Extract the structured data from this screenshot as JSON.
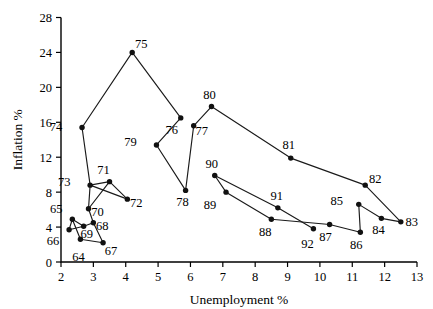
{
  "chart_data": {
    "type": "line",
    "title": "",
    "subtitle": "",
    "xlabel": "Unemployment %",
    "ylabel": "Inflation %",
    "xlim": [
      2,
      13
    ],
    "ylim": [
      0,
      28
    ],
    "xticks": [
      2,
      3,
      4,
      5,
      6,
      7,
      8,
      9,
      10,
      11,
      12,
      13
    ],
    "yticks": [
      0,
      4,
      8,
      12,
      16,
      20,
      24,
      28
    ],
    "xtick_labels": [
      "2",
      "3",
      "4",
      "5",
      "6",
      "7",
      "8",
      "9",
      "10",
      "11",
      "12",
      "13"
    ],
    "ytick_labels": [
      "0",
      "4",
      "8",
      "12",
      "16",
      "20",
      "24",
      "28"
    ],
    "grid": false,
    "legend": "none",
    "marker": "filled-circle",
    "line_color": "#1a1a1a",
    "marker_color": "#111111",
    "series": [
      {
        "name": "Phillips curve loop 1964-1992",
        "point_label_key": "year",
        "points": [
          {
            "year": "64",
            "x": 2.6,
            "y": 2.6,
            "label_dx": -2,
            "label_dy": 22
          },
          {
            "year": "65",
            "x": 2.35,
            "y": 4.9,
            "label_dx": -16,
            "label_dy": -6
          },
          {
            "year": "66",
            "x": 2.25,
            "y": 3.7,
            "label_dx": -16,
            "label_dy": 15
          },
          {
            "year": "67",
            "x": 3.3,
            "y": 2.2,
            "label_dx": 8,
            "label_dy": 12
          },
          {
            "year": "68",
            "x": 3.0,
            "y": 4.5,
            "label_dx": 9,
            "label_dy": 7
          },
          {
            "year": "69",
            "x": 2.7,
            "y": 4.1,
            "label_dx": 3,
            "label_dy": 12
          },
          {
            "year": "70",
            "x": 2.85,
            "y": 6.1,
            "label_dx": 9,
            "label_dy": 7
          },
          {
            "year": "71",
            "x": 3.5,
            "y": 9.2,
            "label_dx": -6,
            "label_dy": -8
          },
          {
            "year": "72",
            "x": 4.05,
            "y": 7.2,
            "label_dx": 9,
            "label_dy": 8
          },
          {
            "year": "73",
            "x": 2.9,
            "y": 8.8,
            "label_dx": -26,
            "label_dy": 1
          },
          {
            "year": "74",
            "x": 2.65,
            "y": 15.4,
            "label_dx": -26,
            "label_dy": 3
          },
          {
            "year": "75",
            "x": 4.2,
            "y": 24.0,
            "label_dx": 9,
            "label_dy": -4
          },
          {
            "year": "76",
            "x": 5.7,
            "y": 16.5,
            "label_dx": -9,
            "label_dy": 16
          },
          {
            "year": "77",
            "x": 6.1,
            "y": 15.6,
            "label_dx": 8,
            "label_dy": 9
          },
          {
            "year": "78",
            "x": 5.85,
            "y": 8.2,
            "label_dx": -3,
            "label_dy": 16
          },
          {
            "year": "79",
            "x": 4.95,
            "y": 13.4,
            "label_dx": -26,
            "label_dy": 1
          },
          {
            "year": "80",
            "x": 6.65,
            "y": 17.8,
            "label_dx": -2,
            "label_dy": -8
          },
          {
            "year": "81",
            "x": 9.1,
            "y": 11.9,
            "label_dx": -2,
            "label_dy": -9
          },
          {
            "year": "82",
            "x": 11.4,
            "y": 8.8,
            "label_dx": 10,
            "label_dy": -2
          },
          {
            "year": "83",
            "x": 12.5,
            "y": 4.6,
            "label_dx": 11,
            "label_dy": 4
          },
          {
            "year": "84",
            "x": 11.9,
            "y": 5.0,
            "label_dx": -3,
            "label_dy": 16
          },
          {
            "year": "85",
            "x": 11.2,
            "y": 6.6,
            "label_dx": -22,
            "label_dy": 1
          },
          {
            "year": "86",
            "x": 11.25,
            "y": 3.4,
            "label_dx": -4,
            "label_dy": 17
          },
          {
            "year": "87",
            "x": 10.3,
            "y": 4.3,
            "label_dx": -4,
            "label_dy": 17
          },
          {
            "year": "88",
            "x": 8.5,
            "y": 4.9,
            "label_dx": -6,
            "label_dy": 17
          },
          {
            "year": "89",
            "x": 7.1,
            "y": 8.0,
            "label_dx": -16,
            "label_dy": 17
          },
          {
            "year": "90",
            "x": 6.75,
            "y": 9.9,
            "label_dx": -3,
            "label_dy": -8
          },
          {
            "year": "91",
            "x": 8.7,
            "y": 6.2,
            "label_dx": -1,
            "label_dy": -8
          },
          {
            "year": "92",
            "x": 9.8,
            "y": 3.8,
            "label_dx": -6,
            "label_dy": 19
          }
        ],
        "segments": [
          [
            "64",
            "65"
          ],
          [
            "65",
            "66"
          ],
          [
            "66",
            "69"
          ],
          [
            "69",
            "65"
          ],
          [
            "69",
            "68"
          ],
          [
            "68",
            "70"
          ],
          [
            "70",
            "71"
          ],
          [
            "71",
            "73"
          ],
          [
            "71",
            "72"
          ],
          [
            "73",
            "74"
          ],
          [
            "73",
            "70"
          ],
          [
            "74",
            "75"
          ],
          [
            "75",
            "76"
          ],
          [
            "76",
            "79"
          ],
          [
            "79",
            "78"
          ],
          [
            "78",
            "77"
          ],
          [
            "77",
            "80"
          ],
          [
            "80",
            "81"
          ],
          [
            "81",
            "82"
          ],
          [
            "82",
            "83"
          ],
          [
            "83",
            "84"
          ],
          [
            "84",
            "85"
          ],
          [
            "85",
            "86"
          ],
          [
            "86",
            "87"
          ],
          [
            "87",
            "88"
          ],
          [
            "88",
            "89"
          ],
          [
            "89",
            "90"
          ],
          [
            "90",
            "91"
          ],
          [
            "91",
            "92"
          ],
          [
            "64",
            "67"
          ],
          [
            "67",
            "68"
          ],
          [
            "72",
            "73"
          ]
        ]
      }
    ]
  }
}
